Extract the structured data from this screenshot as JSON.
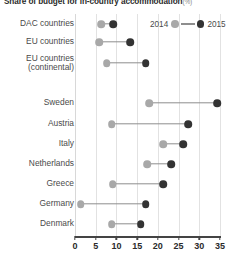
{
  "title": {
    "text": "Share of budget for in-country accommodation",
    "unit": "(%)"
  },
  "legend": {
    "position": "top-right",
    "entries": [
      {
        "label": "2014",
        "color": "#a8a8a8",
        "marker": "circle"
      },
      {
        "label": "2015",
        "color": "#333333",
        "marker": "circle"
      }
    ]
  },
  "axis": {
    "x_ticks": [
      "0",
      "5",
      "10",
      "15",
      "20",
      "25",
      "30",
      "35"
    ],
    "x_min": 0,
    "x_max": 35,
    "x_step": 5,
    "grid": true
  },
  "chart_data": {
    "type": "scatter",
    "subtype": "dumbbell",
    "xlabel": "",
    "ylabel": "",
    "xlim": [
      0,
      35
    ],
    "grid": true,
    "legend_position": "top-right",
    "categories": [
      "DAC countries",
      "EU countries",
      "EU countries (continental)",
      "Sweden",
      "Austria",
      "Italy",
      "Netherlands",
      "Greece",
      "Germany",
      "Denmark"
    ],
    "series": [
      {
        "name": "2014",
        "color": "#a8a8a8",
        "values": [
          6.3,
          5.8,
          7.7,
          17.9,
          8.9,
          21.3,
          17.4,
          9.1,
          1.4,
          8.9
        ]
      },
      {
        "name": "2015",
        "color": "#333333",
        "values": [
          9.2,
          13.3,
          17.1,
          34.3,
          27.3,
          26.1,
          23.2,
          21.3,
          17.1,
          15.9
        ]
      }
    ]
  },
  "rows": [
    {
      "label": "DAC countries",
      "y": 24,
      "v2014": 6.3,
      "v2015": 9.2
    },
    {
      "label": "EU countries",
      "y": 42,
      "v2014": 5.8,
      "v2015": 13.3
    },
    {
      "label": "EU countries\n(continental)",
      "y": 63,
      "v2014": 7.7,
      "v2015": 17.1
    },
    {
      "label": "Sweden",
      "y": 103,
      "v2014": 17.9,
      "v2015": 34.3
    },
    {
      "label": "Austria",
      "y": 124,
      "v2014": 8.9,
      "v2015": 27.3
    },
    {
      "label": "Italy",
      "y": 144,
      "v2014": 21.3,
      "v2015": 26.1
    },
    {
      "label": "Netherlands",
      "y": 164,
      "v2014": 17.4,
      "v2015": 23.2
    },
    {
      "label": "Greece",
      "y": 184,
      "v2014": 9.1,
      "v2015": 21.3
    },
    {
      "label": "Germany",
      "y": 204,
      "v2014": 1.4,
      "v2015": 17.1
    },
    {
      "label": "Denmark",
      "y": 224,
      "v2014": 8.9,
      "v2015": 15.9
    }
  ]
}
